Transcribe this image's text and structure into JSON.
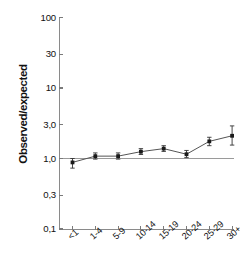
{
  "chart_data": {
    "type": "line",
    "title": "",
    "xlabel": "",
    "ylabel": "Observed/expected",
    "yscale": "log",
    "ylim": [
      0.1,
      100
    ],
    "grid": false,
    "legend": null,
    "reference_line": 1.0,
    "y_ticks": [
      "100",
      "30",
      "10",
      "3,0",
      "1,0",
      "0,3",
      "0,1"
    ],
    "y_tick_values": [
      100,
      30,
      10,
      3.0,
      1.0,
      0.3,
      0.1
    ],
    "categories": [
      "<1",
      "1-4",
      "5-9",
      "10-14",
      "15-19",
      "20-24",
      "25-29",
      "30+"
    ],
    "values": [
      0.88,
      1.08,
      1.08,
      1.25,
      1.38,
      1.15,
      1.75,
      2.1
    ],
    "ci_low": [
      0.73,
      0.98,
      0.98,
      1.14,
      1.26,
      1.03,
      1.52,
      1.55
    ],
    "ci_high": [
      1.0,
      1.2,
      1.2,
      1.38,
      1.52,
      1.3,
      2.0,
      2.9
    ],
    "marker": "square",
    "line_color": "#555555",
    "marker_color": "#1a1a1a",
    "errorbar_color": "#333333",
    "axis_color": "#8a8a8a"
  }
}
